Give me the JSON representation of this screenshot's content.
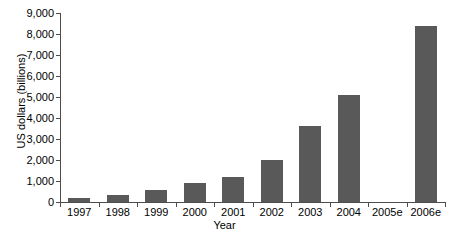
{
  "chart_data": {
    "type": "bar",
    "title": "",
    "xlabel": "Year",
    "ylabel": "US dollars (billions)",
    "categories": [
      "1997",
      "1998",
      "1999",
      "2000",
      "2001",
      "2002",
      "2003",
      "2004",
      "2005e",
      "2006e"
    ],
    "values": [
      200,
      350,
      550,
      900,
      1200,
      2000,
      3600,
      5100,
      null,
      8400
    ],
    "ylim": [
      0,
      9000
    ],
    "ytick_values": [
      0,
      1000,
      2000,
      3000,
      4000,
      5000,
      6000,
      7000,
      8000,
      9000
    ],
    "ytick_labels": [
      "0",
      "1,000",
      "2,000",
      "3,000",
      "4,000",
      "5,000",
      "6,000",
      "7,000",
      "8,000",
      "9,000"
    ],
    "grid": false,
    "legend": false,
    "bar_color": "#595959",
    "axis_color": "#4d4d4d",
    "background": "#ffffff"
  }
}
